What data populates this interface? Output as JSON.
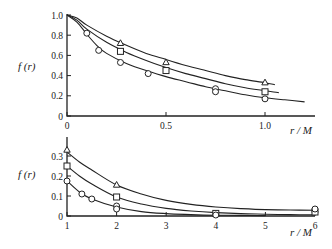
{
  "chart_data": [
    {
      "type": "line",
      "title": "",
      "xlabel": "r / M",
      "ylabel": "f (r)",
      "xlim": [
        0,
        1.25
      ],
      "ylim": [
        0,
        1.0
      ],
      "xticks": [
        0,
        0.5,
        1.0
      ],
      "xtick_labels": [
        "0",
        "0.5",
        "1.0"
      ],
      "yticks": [
        0,
        0.2,
        0.4,
        0.6,
        0.8,
        1.0
      ],
      "ytick_labels": [
        "0",
        "0.2",
        "0.4",
        "0.6",
        "0.8",
        "1.0"
      ],
      "grid": false,
      "series": [
        {
          "name": "triangle",
          "marker": "triangle",
          "curve": {
            "x": [
              0,
              0.05,
              0.1,
              0.2,
              0.3,
              0.4,
              0.5,
              0.6,
              0.7,
              0.8,
              0.9,
              1.0,
              1.05
            ],
            "y": [
              1.0,
              0.97,
              0.9,
              0.79,
              0.7,
              0.62,
              0.56,
              0.5,
              0.45,
              0.4,
              0.36,
              0.33,
              0.31
            ]
          },
          "points": {
            "x": [
              0.27,
              0.5,
              1.0
            ],
            "y": [
              0.72,
              0.53,
              0.33
            ]
          }
        },
        {
          "name": "square",
          "marker": "square",
          "curve": {
            "x": [
              0,
              0.05,
              0.1,
              0.2,
              0.3,
              0.4,
              0.5,
              0.6,
              0.7,
              0.8,
              0.9,
              1.0,
              1.07
            ],
            "y": [
              1.0,
              0.95,
              0.86,
              0.73,
              0.63,
              0.55,
              0.48,
              0.42,
              0.37,
              0.32,
              0.28,
              0.25,
              0.23
            ]
          },
          "points": {
            "x": [
              0.27,
              0.5,
              1.0
            ],
            "y": [
              0.64,
              0.45,
              0.24
            ]
          }
        },
        {
          "name": "circle",
          "marker": "circle",
          "curve": {
            "x": [
              0,
              0.05,
              0.1,
              0.15,
              0.2,
              0.3,
              0.4,
              0.5,
              0.6,
              0.7,
              0.8,
              0.9,
              1.0,
              1.1,
              1.2
            ],
            "y": [
              1.0,
              0.93,
              0.81,
              0.7,
              0.62,
              0.52,
              0.45,
              0.39,
              0.34,
              0.29,
              0.25,
              0.21,
              0.18,
              0.16,
              0.14
            ]
          },
          "points": {
            "x": [
              0.1,
              0.16,
              0.27,
              0.41,
              0.75,
              0.75,
              1.0
            ],
            "y": [
              0.82,
              0.65,
              0.53,
              0.42,
              0.27,
              0.24,
              0.17
            ]
          }
        }
      ]
    },
    {
      "type": "line",
      "title": "",
      "xlabel": "r / M",
      "ylabel": "f (r)",
      "xlim": [
        1,
        6.2
      ],
      "ylim": [
        0,
        0.35
      ],
      "xticks": [
        1,
        2,
        3,
        4,
        5,
        6
      ],
      "xtick_labels": [
        "1",
        "2",
        "3",
        "4",
        "5",
        "6"
      ],
      "yticks": [
        0,
        0.1,
        0.2,
        0.3
      ],
      "ytick_labels": [
        "0",
        "0.1",
        "0.2",
        "0.3"
      ],
      "grid": false,
      "series": [
        {
          "name": "triangle",
          "marker": "triangle",
          "curve": {
            "x": [
              1,
              1.25,
              1.5,
              2,
              2.5,
              3,
              3.5,
              4,
              4.5,
              5,
              5.5,
              6
            ],
            "y": [
              0.32,
              0.27,
              0.23,
              0.155,
              0.11,
              0.078,
              0.058,
              0.045,
              0.037,
              0.032,
              0.03,
              0.029
            ]
          },
          "points": {
            "x": [
              1,
              2,
              6
            ],
            "y": [
              0.33,
              0.155,
              0.03
            ]
          }
        },
        {
          "name": "square",
          "marker": "square",
          "curve": {
            "x": [
              1,
              1.25,
              1.5,
              2,
              2.5,
              3,
              3.5,
              4,
              4.5,
              5,
              5.5,
              6
            ],
            "y": [
              0.25,
              0.2,
              0.16,
              0.095,
              0.06,
              0.038,
              0.025,
              0.017,
              0.012,
              0.009,
              0.007,
              0.006
            ]
          },
          "points": {
            "x": [
              1,
              2,
              4,
              6
            ],
            "y": [
              0.25,
              0.095,
              0.013,
              0.02
            ]
          }
        },
        {
          "name": "circle",
          "marker": "circle",
          "curve": {
            "x": [
              1,
              1.25,
              1.5,
              2,
              2.5,
              3,
              3.5,
              4,
              4.5,
              5
            ],
            "y": [
              0.175,
              0.12,
              0.085,
              0.045,
              0.022,
              0.012,
              0.007,
              0.004,
              0.003,
              0.002
            ]
          },
          "points": {
            "x": [
              1,
              1.3,
              1.5,
              2,
              2,
              4,
              6
            ],
            "y": [
              0.175,
              0.11,
              0.085,
              0.05,
              0.035,
              0.005,
              0.035
            ]
          }
        }
      ]
    }
  ]
}
